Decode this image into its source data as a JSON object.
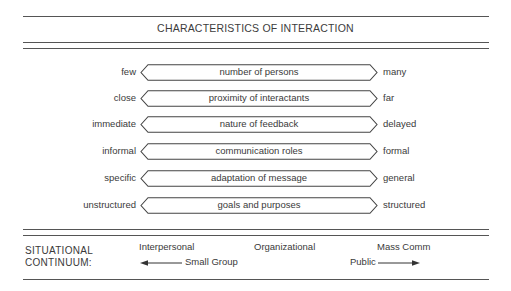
{
  "title": "CHARACTERISTICS OF INTERACTION",
  "rows": [
    {
      "left": "few",
      "center": "number of persons",
      "right": "many"
    },
    {
      "left": "close",
      "center": "proximity of interactants",
      "right": "far"
    },
    {
      "left": "immediate",
      "center": "nature of feedback",
      "right": "delayed"
    },
    {
      "left": "informal",
      "center": "communication roles",
      "right": "formal"
    },
    {
      "left": "specific",
      "center": "adaptation of message",
      "right": "general"
    },
    {
      "left": "unstructured",
      "center": "goals and purposes",
      "right": "structured"
    }
  ],
  "continuum": {
    "label_line1": "SITUATIONAL",
    "label_line2": "CONTINUUM:",
    "interpersonal": "Interpersonal",
    "small_group": "Small Group",
    "organizational": "Organizational",
    "public": "Public",
    "mass_comm": "Mass Comm"
  }
}
